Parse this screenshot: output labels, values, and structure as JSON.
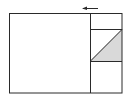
{
  "diagram": {
    "colors": {
      "stroke": "#2a2a2a",
      "shade": "#d9d9d9",
      "background": "#ffffff"
    },
    "outer_rect": {
      "x": 9,
      "y": 13,
      "w": 113,
      "h": 80
    },
    "divider_x": 90,
    "inner_box": {
      "x": 90,
      "y": 29,
      "w": 32,
      "h": 32
    },
    "shaded_triangle": [
      [
        90,
        61
      ],
      [
        122,
        29
      ],
      [
        122,
        61
      ]
    ],
    "arrow": {
      "x1": 98,
      "x2": 82,
      "y": 8,
      "direction": "left"
    }
  }
}
